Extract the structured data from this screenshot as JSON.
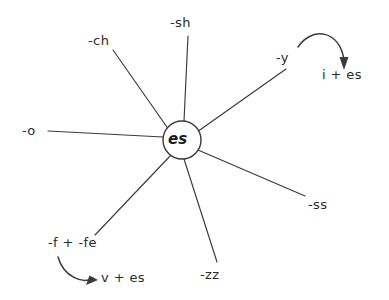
{
  "diagram": {
    "type": "radial-spoke",
    "title": "",
    "background_color": "#ffffff",
    "ink_color": "#3a3a3a",
    "hub": {
      "label": "es",
      "cx": 182,
      "cy": 140,
      "r": 19
    },
    "spokes": [
      {
        "id": "sh",
        "label": "-sh",
        "label_x": 170,
        "label_y": 16,
        "line": {
          "x1": 188,
          "y1": 36,
          "x2": 184,
          "y2": 121
        }
      },
      {
        "id": "ch",
        "label": "-ch",
        "label_x": 88,
        "label_y": 34,
        "line": {
          "x1": 113,
          "y1": 50,
          "x2": 169,
          "y2": 130
        }
      },
      {
        "id": "o",
        "label": "-o",
        "label_x": 22,
        "label_y": 124,
        "line": {
          "x1": 48,
          "y1": 131,
          "x2": 163,
          "y2": 137
        }
      },
      {
        "id": "y",
        "label": "-y",
        "label_x": 276,
        "label_y": 51,
        "line": {
          "x1": 286,
          "y1": 69,
          "x2": 197,
          "y2": 132
        }
      },
      {
        "id": "ss",
        "label": "-ss",
        "label_x": 308,
        "label_y": 198,
        "line": {
          "x1": 305,
          "y1": 196,
          "x2": 198,
          "y2": 150
        }
      },
      {
        "id": "zz",
        "label": "-zz",
        "label_x": 200,
        "label_y": 268,
        "line": {
          "x1": 217,
          "y1": 262,
          "x2": 184,
          "y2": 159
        }
      },
      {
        "id": "f-fe",
        "label": "-f + -fe",
        "label_x": 48,
        "label_y": 236,
        "line": {
          "x1": 95,
          "y1": 235,
          "x2": 171,
          "y2": 155
        }
      }
    ],
    "transforms": [
      {
        "id": "y-to-i-es",
        "from": "y",
        "result": "i + es",
        "result_x": 322,
        "result_y": 68,
        "curve": "M 298 47 C 312 26, 340 30, 344 60",
        "arrow_points": "344,70 339.5,57 348.5,57"
      },
      {
        "id": "f-fe-to-v-es",
        "from": "f-fe",
        "result": "v + es",
        "result_x": 101,
        "result_y": 271,
        "curve": "M 58 257 C 64 278, 84 284, 93 278",
        "arrow_points": "98,280 86,285 89.5,275.5"
      }
    ]
  }
}
